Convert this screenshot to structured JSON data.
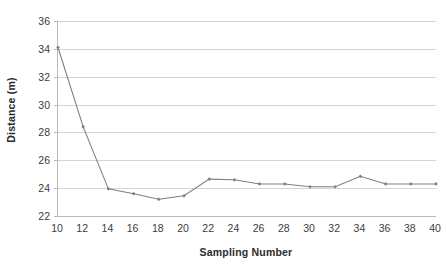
{
  "chart_data": {
    "type": "line",
    "title": "",
    "xlabel": "Sampling Number",
    "ylabel": "Distance (m)",
    "x": [
      10,
      12,
      14,
      16,
      18,
      20,
      22,
      24,
      26,
      28,
      30,
      32,
      34,
      36,
      38,
      40
    ],
    "values": [
      34.1,
      28.4,
      23.95,
      23.6,
      23.2,
      23.45,
      24.65,
      24.6,
      24.3,
      24.3,
      24.1,
      24.1,
      24.85,
      24.3,
      24.3,
      24.3
    ],
    "series": [
      {
        "name": "Distance",
        "values": [
          34.1,
          28.4,
          23.95,
          23.6,
          23.2,
          23.45,
          24.65,
          24.6,
          24.3,
          24.3,
          24.1,
          24.1,
          24.85,
          24.3,
          24.3,
          24.3
        ]
      }
    ],
    "xlim": [
      10,
      40
    ],
    "ylim": [
      22,
      36
    ],
    "xticks": [
      10,
      12,
      14,
      16,
      18,
      20,
      22,
      24,
      26,
      28,
      30,
      32,
      34,
      36,
      38,
      40
    ],
    "yticks": [
      22,
      24,
      26,
      28,
      30,
      32,
      34,
      36
    ],
    "xtick_labels": [
      "10",
      "12",
      "14",
      "16",
      "18",
      "20",
      "22",
      "24",
      "26",
      "28",
      "30",
      "32",
      "34",
      "36",
      "38",
      "40"
    ],
    "ytick_labels": [
      "22",
      "24",
      "26",
      "28",
      "30",
      "32",
      "34",
      "36"
    ],
    "grid": "horizontal",
    "legend": "none",
    "line_color": "#808080",
    "marker_color": "#808080",
    "marker": "diamond",
    "gridline_color": "#d4d4d4",
    "axis_color": "#b9b9b9",
    "background_color": "#ffffff"
  }
}
